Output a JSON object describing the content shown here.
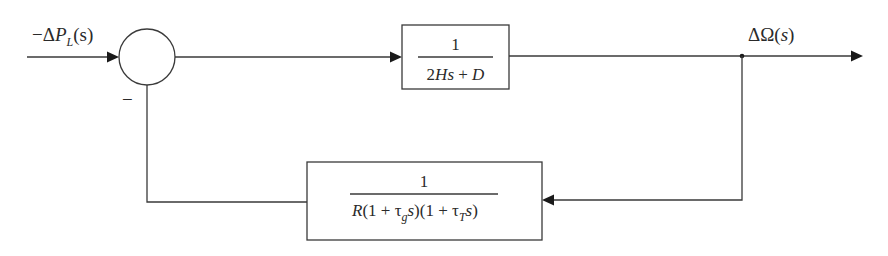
{
  "diagram": {
    "type": "control-system-block-diagram",
    "input_signal": {
      "prefix": "−Δ",
      "var": "P",
      "subscript": "L",
      "arg": "(s)"
    },
    "summing_junction": {
      "feedback_sign": "−"
    },
    "forward_block": {
      "numerator": "1",
      "denominator": {
        "part1": "2",
        "part2": "Hs",
        "part3": " + ",
        "part4": "D"
      }
    },
    "output_signal": {
      "prefix": "ΔΩ",
      "arg_open": "(",
      "arg_var": "s",
      "arg_close": ")"
    },
    "feedback_block": {
      "numerator": "1",
      "denominator": {
        "R": "R",
        "open1": "(1 + τ",
        "sub_g": "g",
        "s1": "s",
        "close1": ")",
        "open2": "(1 + τ",
        "sub_T": "T",
        "s2": "s",
        "close2": ")"
      }
    },
    "colors": {
      "line": "#3a3a3a",
      "arrow": "#1a1a1a",
      "background": "#ffffff"
    }
  }
}
